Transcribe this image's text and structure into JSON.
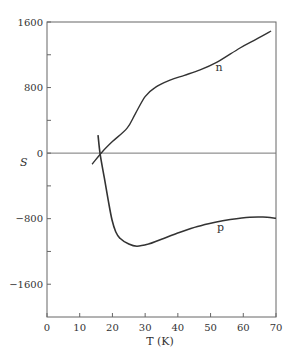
{
  "chart_data": {
    "type": "line",
    "title": "",
    "xlabel": "T (K)",
    "ylabel": "S",
    "xlim": [
      0,
      70
    ],
    "ylim": [
      -2000,
      1600
    ],
    "x_ticks": [
      0,
      10,
      20,
      30,
      40,
      50,
      60,
      70
    ],
    "y_ticks_labeled": [
      1600,
      800,
      0,
      -800,
      -1600
    ],
    "y_ticks_minor": [
      1200,
      400,
      -400,
      -1200
    ],
    "y_tick_labels": [
      "1600",
      "800",
      "0",
      "−800",
      "−1600"
    ],
    "grid": false,
    "zero_line": true,
    "legend": "inline labels",
    "series": [
      {
        "name": "n",
        "x": [
          13.8,
          17,
          20,
          24.5,
          27,
          30,
          33,
          37.6,
          42,
          46.8,
          52,
          59,
          64,
          68.5
        ],
        "y": [
          -135,
          20,
          140,
          305,
          480,
          690,
          800,
          890,
          950,
          1015,
          1110,
          1283,
          1390,
          1490
        ],
        "label_pos": [
          51.5,
          1000
        ]
      },
      {
        "name": "p",
        "x": [
          15.6,
          16.2,
          17.5,
          18.7,
          19.9,
          21,
          22.3,
          25,
          27.5,
          31,
          35,
          40.7,
          46,
          51.4,
          56,
          62,
          66,
          70
        ],
        "y": [
          220,
          0,
          -300,
          -575,
          -820,
          -960,
          -1040,
          -1110,
          -1136,
          -1110,
          -1050,
          -965,
          -895,
          -843,
          -810,
          -782,
          -780,
          -794
        ],
        "label_pos": [
          52,
          -950
        ]
      }
    ]
  }
}
